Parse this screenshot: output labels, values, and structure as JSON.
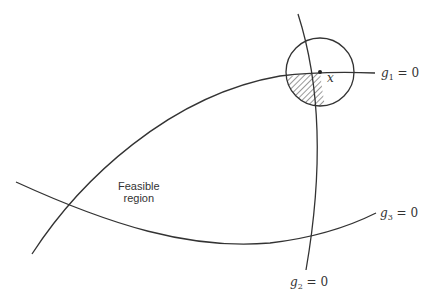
{
  "diagram": {
    "type": "constraint-feasible-region",
    "region_label_line1": "Feasible",
    "region_label_line2": "region",
    "point_label": "x",
    "constraints": [
      {
        "var": "g",
        "sub": "1",
        "eq": "= 0"
      },
      {
        "var": "g",
        "sub": "2",
        "eq": "= 0"
      },
      {
        "var": "g",
        "sub": "3",
        "eq": "= 0"
      }
    ],
    "colors": {
      "stroke": "#333333",
      "background": "#ffffff"
    }
  }
}
